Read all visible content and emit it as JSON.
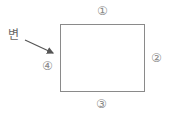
{
  "diagram": {
    "label": "변",
    "edges": [
      {
        "id": 1,
        "mark": "①",
        "position": "top"
      },
      {
        "id": 2,
        "mark": "②",
        "position": "right"
      },
      {
        "id": 3,
        "mark": "③",
        "position": "bottom"
      },
      {
        "id": 4,
        "mark": "④",
        "position": "left"
      }
    ],
    "arrow_target": "left edge",
    "colors": {
      "stroke": "#8a8a8a",
      "arrow": "#555555",
      "text": "#777777"
    }
  }
}
